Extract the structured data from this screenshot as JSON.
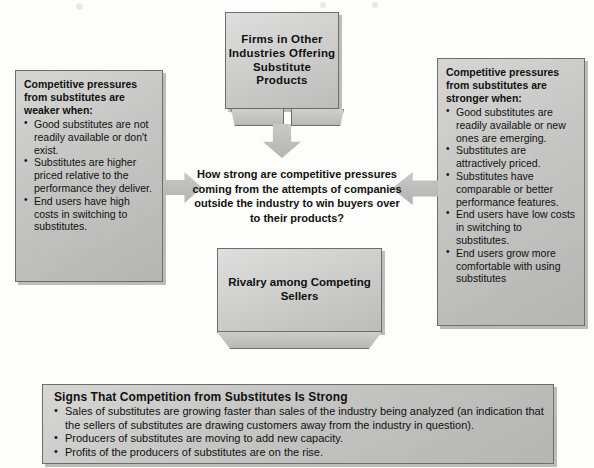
{
  "diagram": {
    "top_box": {
      "title": "Firms in Other Industries Offering Substitute Products"
    },
    "center_question": "How strong are competitive pressures coming from the attempts of companies outside the industry to win buyers over to their products?",
    "rivalry_box": {
      "title": "Rivalry among Competing Sellers"
    },
    "left_panel": {
      "heading": "Competitive pressures from substitutes are weaker when:",
      "bullets": [
        "Good substitutes are not readily available or don't exist.",
        "Substitutes are higher priced relative to the performance they deliver.",
        "End users have high costs in switching to substitutes."
      ]
    },
    "right_panel": {
      "heading": "Competitive pressures from substitutes are stronger when:",
      "bullets": [
        "Good substitutes are readily available or new ones are emerging.",
        "Substitutes are attractively priced.",
        "Substitutes have comparable or better performance features.",
        "End users have low costs in switching to substitutes.",
        "End users grow more comfortable with using substitutes"
      ]
    },
    "signs_panel": {
      "title": "Signs That Competition from Substitutes Is Strong",
      "bullets": [
        "Sales of substitutes are growing faster than sales of the industry being analyzed (an indication that the sellers of substitutes are drawing customers away from the industry in question).",
        "Producers of substitutes are moving to add new capacity.",
        "Profits of the producers of substitutes are on the rise."
      ]
    },
    "arrows": {
      "down": "down-arrow",
      "left_to_center": "right-pointing-arrow",
      "right_to_center": "left-pointing-arrow"
    },
    "colors": {
      "box_fill_light": "#dedede",
      "box_fill_dark": "#b5b5b3",
      "box_border": "#6d6d6b",
      "text": "#111111",
      "page_background": "#fdfdfc"
    }
  }
}
